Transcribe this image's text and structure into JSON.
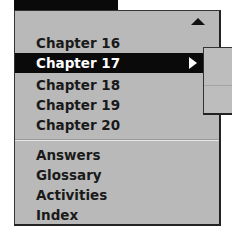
{
  "menu": {
    "scroll_up_icon": "triangle-up",
    "chapters": [
      {
        "label": "Chapter 16",
        "selected": false
      },
      {
        "label": "Chapter 17",
        "selected": true,
        "has_submenu": true
      },
      {
        "label": "Chapter 18",
        "selected": false
      },
      {
        "label": "Chapter 19",
        "selected": false
      },
      {
        "label": "Chapter 20",
        "selected": false
      }
    ],
    "extras": [
      {
        "label": "Answers"
      },
      {
        "label": "Glossary"
      },
      {
        "label": "Activities"
      },
      {
        "label": "Index"
      }
    ]
  },
  "colors": {
    "menu_bg": "#b9b9b9",
    "selection_bg": "#0a0a0a",
    "selection_text": "#ffffff"
  }
}
